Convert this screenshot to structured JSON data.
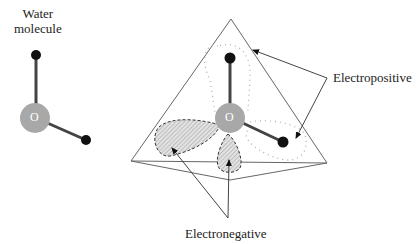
{
  "diagram": {
    "left_label_line1": "Water",
    "left_label_line2": "molecule",
    "oxygen_left": "O",
    "oxygen_right": "O",
    "label_positive": "Electropositive",
    "label_negative": "Electronegative"
  },
  "colors": {
    "oxygen": "#a8a8a8",
    "hydrogen": "#111111",
    "bond": "#444444",
    "lines": "#555555",
    "lobe_fill": "#d8d8d8",
    "dots": "#aaaaaa"
  }
}
